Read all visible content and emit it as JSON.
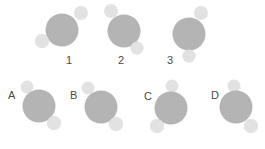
{
  "figure": {
    "type": "molecule-orientation-diagram",
    "width": 265,
    "height": 149,
    "background_color": "#ffffff",
    "colors": {
      "central_atom": "#b4b4b4",
      "outer_atom": "#e2e2e2",
      "label_text": "#4a4a4a"
    },
    "atom_geometry": {
      "central_radius": 16,
      "outer_radius": 7
    }
  },
  "top_row": {
    "molecules": [
      {
        "label": "1",
        "label_x": 69,
        "label_y": 61,
        "central": {
          "cx": 62,
          "cy": 30,
          "r": 16.5
        },
        "outer": [
          {
            "name": "upper-right-atom",
            "cx": 81,
            "cy": 13,
            "r": 7
          },
          {
            "name": "lower-left-atom",
            "cx": 42,
            "cy": 41,
            "r": 7
          }
        ]
      },
      {
        "label": "2",
        "label_x": 121,
        "label_y": 61,
        "central": {
          "cx": 124,
          "cy": 31,
          "r": 16.5
        },
        "outer": [
          {
            "name": "upper-left-atom",
            "cx": 111,
            "cy": 11,
            "r": 7
          },
          {
            "name": "lower-right-atom",
            "cx": 137,
            "cy": 48,
            "r": 6.5
          }
        ]
      },
      {
        "label": "3",
        "label_x": 170,
        "label_y": 61,
        "central": {
          "cx": 189,
          "cy": 34,
          "r": 16.5
        },
        "outer": [
          {
            "name": "upper-right-atom",
            "cx": 201,
            "cy": 13,
            "r": 7
          },
          {
            "name": "bottom-atom",
            "cx": 189,
            "cy": 56,
            "r": 6.5
          }
        ]
      }
    ]
  },
  "bottom_row": {
    "molecules": [
      {
        "label": "A",
        "label_x": 8,
        "label_y": 96,
        "central": {
          "cx": 39,
          "cy": 106,
          "r": 16.5
        },
        "outer": [
          {
            "name": "upper-left-atom",
            "cx": 27,
            "cy": 87,
            "r": 6.5
          },
          {
            "name": "lower-right-atom",
            "cx": 54,
            "cy": 123,
            "r": 7
          }
        ]
      },
      {
        "label": "B",
        "label_x": 70,
        "label_y": 96,
        "central": {
          "cx": 101,
          "cy": 107,
          "r": 16.5
        },
        "outer": [
          {
            "name": "upper-left-atom",
            "cx": 88,
            "cy": 88,
            "r": 6.5
          },
          {
            "name": "lower-right-atom",
            "cx": 116,
            "cy": 124,
            "r": 7
          }
        ]
      },
      {
        "label": "C",
        "label_x": 144,
        "label_y": 97,
        "central": {
          "cx": 171,
          "cy": 108,
          "r": 16.5
        },
        "outer": [
          {
            "name": "top-atom",
            "cx": 172,
            "cy": 86,
            "r": 6.5
          },
          {
            "name": "lower-left-atom",
            "cx": 157,
            "cy": 126,
            "r": 7
          }
        ]
      },
      {
        "label": "D",
        "label_x": 211,
        "label_y": 96,
        "central": {
          "cx": 236,
          "cy": 107,
          "r": 16.5
        },
        "outer": [
          {
            "name": "top-atom",
            "cx": 234,
            "cy": 86,
            "r": 6.5
          },
          {
            "name": "lower-right-atom",
            "cx": 251,
            "cy": 126,
            "r": 7
          }
        ]
      }
    ]
  }
}
